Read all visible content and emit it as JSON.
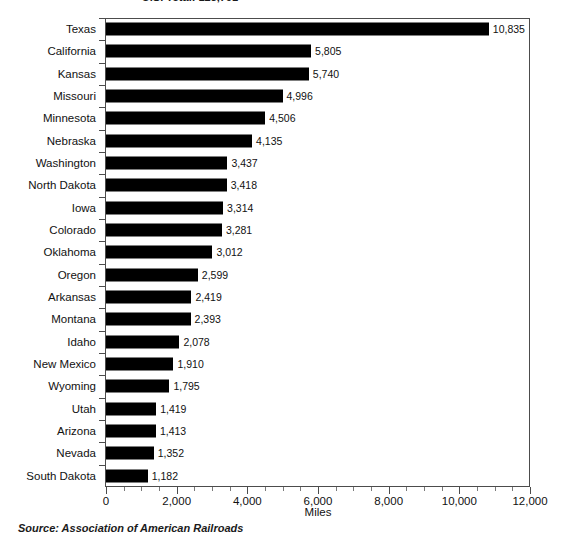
{
  "chart_data": {
    "type": "bar",
    "orientation": "horizontal",
    "title": "U.S. Total: 123,791",
    "xlabel": "Miles",
    "ylabel": "",
    "xlim": [
      0,
      12000
    ],
    "xtick_labels": [
      "0",
      "2,000",
      "4,000",
      "6,000",
      "8,000",
      "10,000",
      "12,000"
    ],
    "xtick_values": [
      0,
      2000,
      4000,
      6000,
      8000,
      10000,
      12000
    ],
    "minor_tick_step": 500,
    "grid": false,
    "legend": false,
    "bar_color": "#000000",
    "categories": [
      "Texas",
      "California",
      "Kansas",
      "Missouri",
      "Minnesota",
      "Nebraska",
      "Washington",
      "North Dakota",
      "Iowa",
      "Colorado",
      "Oklahoma",
      "Oregon",
      "Arkansas",
      "Montana",
      "Idaho",
      "New Mexico",
      "Wyoming",
      "Utah",
      "Arizona",
      "Nevada",
      "South Dakota"
    ],
    "values": [
      10835,
      5805,
      5740,
      4996,
      4506,
      4135,
      3437,
      3418,
      3314,
      3281,
      3012,
      2599,
      2419,
      2393,
      2078,
      1910,
      1795,
      1419,
      1413,
      1352,
      1182
    ],
    "value_labels": [
      "10,835",
      "5,805",
      "5,740",
      "4,996",
      "4,506",
      "4,135",
      "3,437",
      "3,418",
      "3,314",
      "3,281",
      "3,012",
      "2,599",
      "2,419",
      "2,393",
      "2,078",
      "1,910",
      "1,795",
      "1,419",
      "1,413",
      "1,352",
      "1,182"
    ],
    "source": "Source: Association of American Railroads"
  }
}
